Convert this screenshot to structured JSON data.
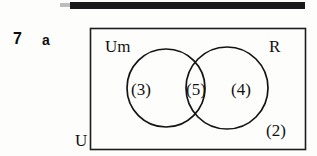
{
  "page": {
    "top_rule_present": true
  },
  "question": {
    "number": "7",
    "part": "a"
  },
  "diagram": {
    "type": "venn",
    "universe_label": "U",
    "sets": [
      {
        "id": "left",
        "label": "Um"
      },
      {
        "id": "right",
        "label": "R"
      }
    ],
    "regions": [
      {
        "id": "left-only",
        "label": "(3)",
        "value": 3
      },
      {
        "id": "intersection",
        "label": "(5)",
        "value": 5
      },
      {
        "id": "right-only",
        "label": "(4)",
        "value": 4
      },
      {
        "id": "outside",
        "label": "(2)",
        "value": 2
      }
    ],
    "colors": {
      "stroke": "#141414",
      "rect_stroke": "#1d1d1d",
      "text": "#111111",
      "background": "#fdfdfc"
    }
  }
}
